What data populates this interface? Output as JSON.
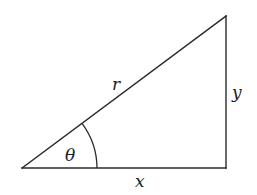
{
  "diagram": {
    "type": "right-triangle",
    "labels": {
      "hypotenuse": "r",
      "opposite": "y",
      "adjacent": "x",
      "angle": "θ"
    },
    "colors": {
      "stroke": "#2a2a2a",
      "text": "#222222",
      "background": "#ffffff"
    }
  }
}
